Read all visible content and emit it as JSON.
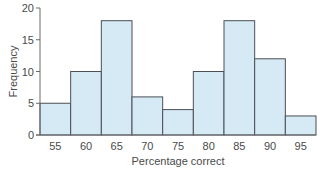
{
  "chart_data": {
    "type": "bar",
    "title": "",
    "xlabel": "Percentage correct",
    "ylabel": "Frequency",
    "categories": [
      "55",
      "60",
      "65",
      "70",
      "75",
      "80",
      "85",
      "90",
      "95"
    ],
    "values": [
      5,
      10,
      18,
      6,
      4,
      10,
      18,
      12,
      3
    ],
    "ylim": [
      0,
      20
    ],
    "yticks": [
      "0",
      "5",
      "10",
      "15",
      "20"
    ],
    "ytick_values": [
      0,
      5,
      10,
      15,
      20
    ],
    "grid": false,
    "legend": null,
    "bar_color": "#d6eaf6",
    "bar_edge_color": "#4a4f55"
  }
}
